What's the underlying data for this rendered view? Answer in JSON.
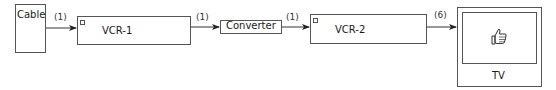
{
  "diagram": {
    "nodes": [
      {
        "id": "cable",
        "label": "Cable"
      },
      {
        "id": "vcr1",
        "label": "VCR-1"
      },
      {
        "id": "converter",
        "label": "Converter"
      },
      {
        "id": "vcr2",
        "label": "VCR-2"
      },
      {
        "id": "tv",
        "label": "TV",
        "icon": "thumbs-up-icon"
      }
    ],
    "edges": [
      {
        "from": "cable",
        "to": "vcr1",
        "label": "(1)"
      },
      {
        "from": "vcr1",
        "to": "converter",
        "label": "(1)"
      },
      {
        "from": "converter",
        "to": "vcr2",
        "label": "(1)"
      },
      {
        "from": "vcr2",
        "to": "tv",
        "label": "(6)"
      }
    ]
  }
}
